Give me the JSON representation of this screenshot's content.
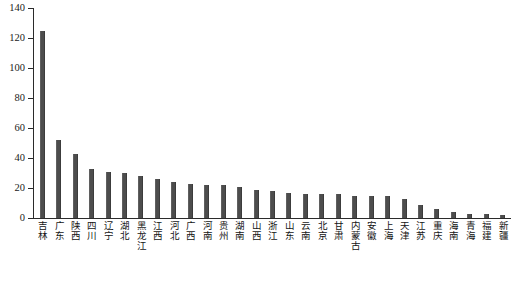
{
  "chart_data": {
    "type": "bar",
    "title": "",
    "subtitle": "",
    "xlabel": "",
    "ylabel": "",
    "ylim": [
      0,
      140
    ],
    "yticks": [
      0,
      20,
      40,
      60,
      80,
      100,
      120,
      140
    ],
    "grid": false,
    "legend": null,
    "bar_color": "#4d4d4d",
    "axis_color": "#2b2b2b",
    "categories": [
      "吉林",
      "广东",
      "陕西",
      "四川",
      "辽宁",
      "湖北",
      "黑龙江",
      "江西",
      "河北",
      "广西",
      "河南",
      "贵州",
      "湖南",
      "山西",
      "浙江",
      "山东",
      "云南",
      "北京",
      "甘肃",
      "内蒙古",
      "安徽",
      "上海",
      "天津",
      "江苏",
      "重庆",
      "海南",
      "青海",
      "福建",
      "新疆"
    ],
    "values": [
      125,
      52,
      43,
      33,
      31,
      30,
      28,
      26,
      24,
      23,
      22,
      22,
      21,
      19,
      18,
      17,
      16,
      16,
      16,
      15,
      15,
      15,
      13,
      9,
      6,
      4,
      3,
      3,
      2
    ]
  }
}
